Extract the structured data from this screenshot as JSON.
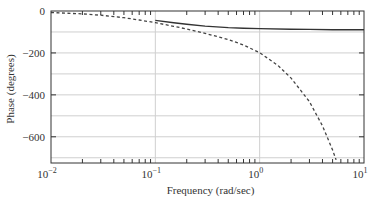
{
  "chart_data": {
    "type": "line",
    "title": "",
    "xlabel": "Frequency (rad/sec)",
    "ylabel": "Phase (degrees)",
    "xscale": "log",
    "xlim": [
      0.01,
      10
    ],
    "ylim": [
      -725,
      0
    ],
    "xticks": [
      0.01,
      0.1,
      1,
      10
    ],
    "xtick_labels": [
      "10",
      "10",
      "10",
      "10"
    ],
    "xtick_exponents": [
      "−2",
      "−1",
      "0",
      "1"
    ],
    "yticks": [
      0,
      -200,
      -400,
      -600
    ],
    "ytick_labels": [
      "0",
      "−200",
      "−400",
      "−600"
    ],
    "grid": {
      "horizontal_every": 100,
      "vertical_at": [
        0.1,
        1
      ]
    },
    "legend": null,
    "series": [
      {
        "name": "solid",
        "style": "solid",
        "color": "#333333",
        "x": [
          0.1,
          0.15,
          0.2,
          0.3,
          0.5,
          0.7,
          1,
          2,
          3,
          5,
          7,
          10
        ],
        "values": [
          -45,
          -56,
          -63,
          -72,
          -79,
          -82,
          -84,
          -87,
          -88,
          -89,
          -89,
          -89
        ]
      },
      {
        "name": "dashed",
        "style": "dashed",
        "color": "#444444",
        "x": [
          0.01,
          0.02,
          0.03,
          0.05,
          0.07,
          0.1,
          0.15,
          0.2,
          0.3,
          0.5,
          0.7,
          1,
          1.5,
          2,
          3,
          4,
          5,
          5.4
        ],
        "values": [
          -7,
          -14,
          -20,
          -32,
          -43,
          -56,
          -73,
          -86,
          -107,
          -136,
          -162,
          -199,
          -260,
          -320,
          -432,
          -548,
          -663,
          -710
        ]
      }
    ]
  },
  "axes": {
    "x_title": "Frequency (rad/sec)",
    "y_title": "Phase (degrees)"
  }
}
